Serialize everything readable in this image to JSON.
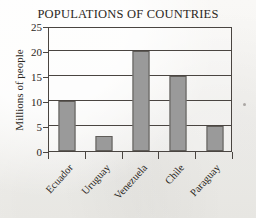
{
  "chart_data": {
    "type": "bar",
    "title": "POPULATIONS OF COUNTRIES",
    "xlabel": "",
    "ylabel": "Millions of people",
    "categories": [
      "Ecuador",
      "Uruguay",
      "Venezuela",
      "Chile",
      "Paraguay"
    ],
    "values": [
      10,
      3,
      20,
      15,
      5
    ],
    "ylim": [
      0,
      25
    ],
    "ytick_step": 5,
    "yticks": [
      0,
      5,
      10,
      15,
      20,
      25
    ],
    "ytick_labels": [
      "0",
      "5",
      "10",
      "15",
      "20",
      "25"
    ],
    "grid": "horizontal",
    "legend": "none",
    "bar_color": "#9a9a9a",
    "bar_border_color": "#5f5c58",
    "axis_color": "#4a4541",
    "text_color": "#2b2723",
    "background_color": "#f6f5f3"
  }
}
